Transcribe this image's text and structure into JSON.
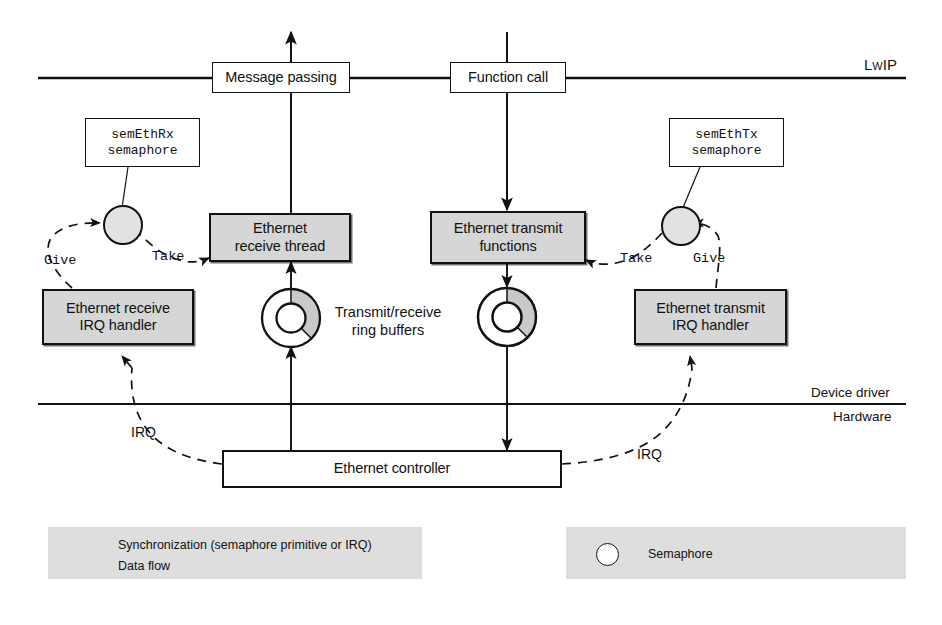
{
  "figure": {
    "colors": {
      "line": "#111111",
      "shaded_box_fill": "#d6d6d6",
      "legend_panel_fill": "#dedede",
      "ring_shaded_sector": "#c9c9c9",
      "background": "#ffffff"
    }
  },
  "layers": [
    {
      "id": "lwip",
      "label": "LwIP",
      "position": "above-top-divider"
    },
    {
      "id": "device_driver",
      "label": "Device driver",
      "position": "above-bottom-divider"
    },
    {
      "id": "hardware",
      "label": "Hardware",
      "position": "below-bottom-divider"
    }
  ],
  "nodes": {
    "message_passing": {
      "label": "Message passing",
      "style": "plain"
    },
    "function_call": {
      "label": "Function call",
      "style": "plain"
    },
    "sem_eth_rx_box": {
      "line1": "semEthRx",
      "line2": "semaphore",
      "style": "mono"
    },
    "sem_eth_tx_box": {
      "line1": "semEthTx",
      "line2": "semaphore",
      "style": "mono"
    },
    "eth_receive_thread": {
      "line1": "Ethernet",
      "line2": "receive thread",
      "style": "shaded"
    },
    "eth_transmit_functions": {
      "line1": "Ethernet transmit",
      "line2": "functions",
      "style": "shaded"
    },
    "eth_receive_irq_handler": {
      "line1": "Ethernet receive",
      "line2": "IRQ handler",
      "style": "shaded"
    },
    "eth_transmit_irq_handler": {
      "line1": "Ethernet transmit",
      "line2": "IRQ handler",
      "style": "shaded"
    },
    "ethernet_controller": {
      "label": "Ethernet controller",
      "style": "plain"
    }
  },
  "free_text": {
    "ring_buffers": {
      "line1": "Transmit/receive",
      "line2": "ring buffers"
    }
  },
  "edge_labels": {
    "give_rx": "Give",
    "take_rx": "Take",
    "give_tx": "Give",
    "take_tx": "Take",
    "irq_left": "IRQ",
    "irq_right": "IRQ"
  },
  "legend": {
    "left": {
      "items": [
        {
          "icon": "dashed-arrow-icon",
          "label": "Synchronization (semaphore primitive or  IRQ)"
        },
        {
          "icon": "solid-arrow-icon",
          "label": "Data flow"
        }
      ]
    },
    "right": {
      "items": [
        {
          "icon": "circle-icon",
          "label": "Semaphore"
        }
      ]
    }
  }
}
